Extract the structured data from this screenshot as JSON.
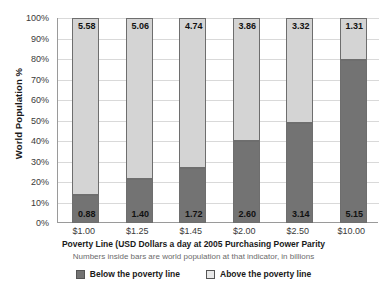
{
  "chart_data": {
    "type": "bar",
    "title": "",
    "subtitle": "Numbers inside bars are world population at that indicator, in billions",
    "xlabel": "Poverty Line (USD Dollars a day at 2005 Purchasing Power Parity",
    "ylabel": "World Population %",
    "ylim": [
      0,
      100
    ],
    "grid": true,
    "stacked": true,
    "stack_mode": "percent",
    "legend_position": "bottom",
    "categories": [
      "$1.00",
      "$1.25",
      "$1.45",
      "$2.00",
      "$2.50",
      "$10.00"
    ],
    "y_ticks": [
      "0%",
      "10%",
      "20%",
      "30%",
      "40%",
      "50%",
      "60%",
      "70%",
      "80%",
      "90%",
      "100%"
    ],
    "y_tick_values": [
      0,
      10,
      20,
      30,
      40,
      50,
      60,
      70,
      80,
      90,
      100
    ],
    "value_unit": "billions of people",
    "world_population_total": 6.46,
    "series": [
      {
        "name": "Below the poverty line",
        "color": "#737373",
        "values": [
          0.88,
          1.4,
          1.72,
          2.6,
          3.14,
          5.15
        ],
        "percents": [
          13.6,
          21.7,
          26.6,
          40.2,
          48.6,
          79.7
        ],
        "labels": [
          "0.88",
          "1.40",
          "1.72",
          "2.60",
          "3.14",
          "5.15"
        ]
      },
      {
        "name": "Above the poverty line",
        "color": "#d4d4d4",
        "values": [
          5.58,
          5.06,
          4.74,
          3.86,
          3.32,
          1.31
        ],
        "percents": [
          86.4,
          78.3,
          73.4,
          59.8,
          51.4,
          20.3
        ],
        "labels": [
          "5.58",
          "5.06",
          "4.74",
          "3.86",
          "3.32",
          "1.31"
        ]
      }
    ]
  },
  "legend": {
    "items": [
      {
        "label": "Below the poverty line",
        "swatch": "legend-swatch-below"
      },
      {
        "label": "Above the poverty line",
        "swatch": "legend-swatch-above"
      }
    ]
  },
  "colors": {
    "below": "#737373",
    "above": "#d4d4d4",
    "gridline": "#d9d9d9",
    "axis": "#9a9a9a",
    "background": "#ffffff"
  }
}
